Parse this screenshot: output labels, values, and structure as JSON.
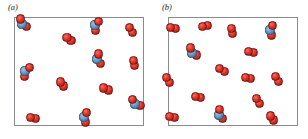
{
  "figure": {
    "background_color": "#ffffff",
    "panels": [
      {
        "id": "a",
        "label": "(a)",
        "box": {
          "x": 14,
          "y": 17,
          "width": 130,
          "height": 109,
          "border_color": "#8a8a8f",
          "fill_color": "#ffffff"
        },
        "description": "Mixture containing red-blue-red triatomic molecules and red-red diatomic molecules",
        "counts": {
          "triatomic_red_blue_red": 7,
          "diatomic_red_red": 9,
          "total": 16
        }
      },
      {
        "id": "b",
        "label": "(b)",
        "box": {
          "x": 160,
          "y": 17,
          "width": 130,
          "height": 109,
          "border_color": "#8a8a8f",
          "fill_color": "#ffffff"
        },
        "description": "Mixture containing mostly red-red diatomic molecules with a few red-blue-red triatomic molecules",
        "counts": {
          "triatomic_red_blue_red": 3,
          "diatomic_red_red": 14,
          "total": 17
        }
      }
    ]
  },
  "legend_colors": {
    "red_atom": "#d3291f",
    "blue_atom": "#5b8cb8",
    "frame": "#8a8a8f",
    "label_text": "#231f20"
  },
  "molecules": {
    "panel_a": [
      {
        "type": "triatomic",
        "x": 22,
        "y": 24,
        "rotation": -38,
        "atoms": [
          "red",
          "blue",
          "red"
        ]
      },
      {
        "type": "triatomic",
        "x": 95,
        "y": 25,
        "rotation": 18,
        "atoms": [
          "red",
          "blue",
          "red"
        ]
      },
      {
        "type": "diatomic",
        "x": 131,
        "y": 30,
        "rotation": 62,
        "atoms": [
          "red",
          "red"
        ]
      },
      {
        "type": "diatomic",
        "x": 69,
        "y": 39,
        "rotation": 40,
        "atoms": [
          "red",
          "red"
        ]
      },
      {
        "type": "triatomic",
        "x": 97,
        "y": 59,
        "rotation": -12,
        "atoms": [
          "red",
          "blue",
          "red"
        ]
      },
      {
        "type": "diatomic",
        "x": 134,
        "y": 63,
        "rotation": 72,
        "atoms": [
          "red",
          "red"
        ]
      },
      {
        "type": "triatomic",
        "x": 25,
        "y": 71,
        "rotation": 28,
        "atoms": [
          "red",
          "blue",
          "red"
        ]
      },
      {
        "type": "diatomic",
        "x": 62,
        "y": 84,
        "rotation": 48,
        "atoms": [
          "red",
          "red"
        ]
      },
      {
        "type": "diatomic",
        "x": 106,
        "y": 89,
        "rotation": 24,
        "atoms": [
          "red",
          "red"
        ]
      },
      {
        "type": "triatomic",
        "x": 135,
        "y": 104,
        "rotation": -50,
        "atoms": [
          "red",
          "blue",
          "red"
        ]
      },
      {
        "type": "diatomic",
        "x": 33,
        "y": 118,
        "rotation": 10,
        "atoms": [
          "red",
          "red"
        ]
      },
      {
        "type": "triatomic",
        "x": 84,
        "y": 117,
        "rotation": 8,
        "atoms": [
          "red",
          "blue",
          "red"
        ]
      }
    ],
    "panel_b": [
      {
        "type": "diatomic",
        "x": 173,
        "y": 28,
        "rotation": 20,
        "atoms": [
          "red",
          "red"
        ]
      },
      {
        "type": "diatomic",
        "x": 205,
        "y": 26,
        "rotation": -20,
        "atoms": [
          "red",
          "red"
        ]
      },
      {
        "type": "diatomic",
        "x": 232,
        "y": 31,
        "rotation": 72,
        "atoms": [
          "red",
          "red"
        ]
      },
      {
        "type": "triatomic",
        "x": 270,
        "y": 30,
        "rotation": 8,
        "atoms": [
          "red",
          "blue",
          "red"
        ]
      },
      {
        "type": "triatomic",
        "x": 192,
        "y": 53,
        "rotation": -42,
        "atoms": [
          "red",
          "blue",
          "red"
        ]
      },
      {
        "type": "diatomic",
        "x": 251,
        "y": 52,
        "rotation": 14,
        "atoms": [
          "red",
          "red"
        ]
      },
      {
        "type": "diatomic",
        "x": 222,
        "y": 70,
        "rotation": 36,
        "atoms": [
          "red",
          "red"
        ]
      },
      {
        "type": "diatomic",
        "x": 168,
        "y": 80,
        "rotation": 62,
        "atoms": [
          "red",
          "red"
        ]
      },
      {
        "type": "diatomic",
        "x": 248,
        "y": 78,
        "rotation": 12,
        "atoms": [
          "red",
          "red"
        ]
      },
      {
        "type": "diatomic",
        "x": 277,
        "y": 79,
        "rotation": 60,
        "atoms": [
          "red",
          "red"
        ]
      },
      {
        "type": "diatomic",
        "x": 198,
        "y": 97,
        "rotation": 16,
        "atoms": [
          "red",
          "red"
        ]
      },
      {
        "type": "diatomic",
        "x": 258,
        "y": 101,
        "rotation": 64,
        "atoms": [
          "red",
          "red"
        ]
      },
      {
        "type": "diatomic",
        "x": 172,
        "y": 117,
        "rotation": 14,
        "atoms": [
          "red",
          "red"
        ]
      },
      {
        "type": "triatomic",
        "x": 219,
        "y": 115,
        "rotation": -18,
        "atoms": [
          "red",
          "blue",
          "red"
        ]
      },
      {
        "type": "diatomic",
        "x": 272,
        "y": 118,
        "rotation": 52,
        "atoms": [
          "red",
          "red"
        ]
      }
    ]
  },
  "geometry": {
    "atom_radius_px": 4.6,
    "bond_offset_px": 5.2
  }
}
